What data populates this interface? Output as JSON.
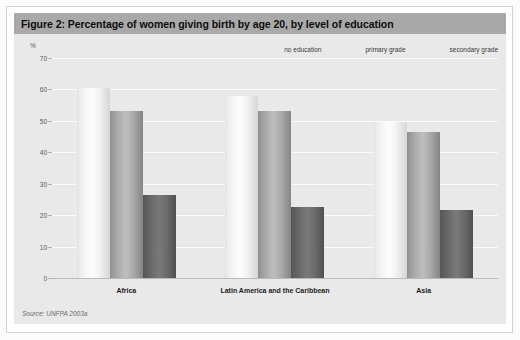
{
  "figure": {
    "title": "Figure 2: Percentage of women giving birth by age 20, by level of education",
    "source": "Source: UNFPA 2003a",
    "axis_unit": "%"
  },
  "colors": {
    "title_band": "#a9a9a9",
    "panel_background": "#e9e9e9",
    "gridline": "#fbfbfb",
    "series_no_education": "#f2f2f2",
    "series_primary_grade": "#b0b0b0",
    "series_secondary_grade": "#6e6e6e"
  },
  "legend": {
    "items": [
      {
        "label": "no education"
      },
      {
        "label": "primary grade"
      },
      {
        "label": "secondary grade"
      }
    ]
  },
  "chart_data": {
    "type": "bar",
    "title": "Figure 2: Percentage of women giving birth by age 20, by level of education",
    "xlabel": "",
    "ylabel": "%",
    "ylim": [
      0,
      70
    ],
    "yticks": [
      0,
      10,
      20,
      30,
      40,
      50,
      60,
      70
    ],
    "ytick_labels": [
      "0",
      "10",
      "20",
      "30",
      "40",
      "50",
      "60",
      "70"
    ],
    "grid": true,
    "legend_position": "top-right",
    "categories": [
      "Africa",
      "Latin America and the Caribbean",
      "Asia"
    ],
    "series": [
      {
        "name": "no education",
        "values": [
          60.5,
          58.0,
          49.5
        ]
      },
      {
        "name": "primary grade",
        "values": [
          53.0,
          53.0,
          46.5
        ]
      },
      {
        "name": "secondary grade",
        "values": [
          26.5,
          22.5,
          21.5
        ]
      }
    ],
    "annotations": [
      "Source: UNFPA 2003a"
    ]
  }
}
